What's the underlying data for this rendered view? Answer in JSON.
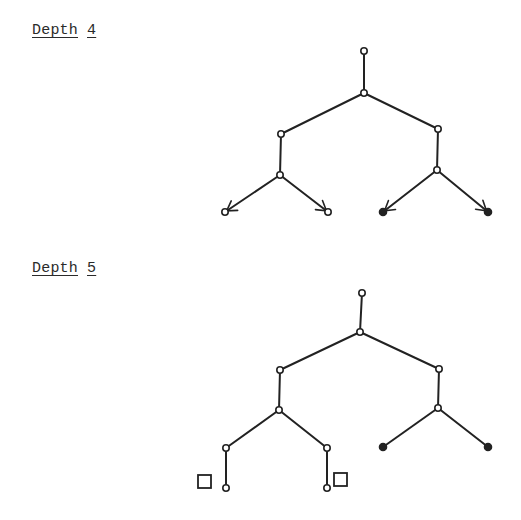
{
  "sections": [
    {
      "title_word": "Depth",
      "title_number": "4",
      "tree": {
        "nodes": [
          {
            "id": "root",
            "x": 364,
            "y": 51,
            "type": "open"
          },
          {
            "id": "n1",
            "x": 364,
            "y": 93,
            "type": "open"
          },
          {
            "id": "L",
            "x": 281,
            "y": 134,
            "type": "open"
          },
          {
            "id": "R",
            "x": 438,
            "y": 129,
            "type": "open"
          },
          {
            "id": "LL",
            "x": 280,
            "y": 175,
            "type": "open"
          },
          {
            "id": "RR",
            "x": 437,
            "y": 170,
            "type": "open"
          },
          {
            "id": "LLa",
            "x": 225,
            "y": 212,
            "type": "open",
            "arrow": true
          },
          {
            "id": "LLb",
            "x": 328,
            "y": 212,
            "type": "open",
            "arrow": true
          },
          {
            "id": "RRa",
            "x": 383,
            "y": 212,
            "type": "filled",
            "arrow": true
          },
          {
            "id": "RRb",
            "x": 488,
            "y": 212,
            "type": "filled",
            "arrow": true
          }
        ],
        "edges": [
          [
            "root",
            "n1"
          ],
          [
            "n1",
            "L"
          ],
          [
            "n1",
            "R"
          ],
          [
            "L",
            "LL"
          ],
          [
            "R",
            "RR"
          ],
          [
            "LL",
            "LLa"
          ],
          [
            "LL",
            "LLb"
          ],
          [
            "RR",
            "RRa"
          ],
          [
            "RR",
            "RRb"
          ]
        ]
      }
    },
    {
      "title_word": "Depth",
      "title_number": "5",
      "tree": {
        "nodes": [
          {
            "id": "root",
            "x": 362,
            "y": 293,
            "type": "open"
          },
          {
            "id": "n1",
            "x": 360,
            "y": 332,
            "type": "open"
          },
          {
            "id": "L",
            "x": 280,
            "y": 370,
            "type": "open"
          },
          {
            "id": "R",
            "x": 439,
            "y": 369,
            "type": "open"
          },
          {
            "id": "LL",
            "x": 279,
            "y": 410,
            "type": "open"
          },
          {
            "id": "RR",
            "x": 438,
            "y": 408,
            "type": "open"
          },
          {
            "id": "LLa",
            "x": 226,
            "y": 448,
            "type": "open"
          },
          {
            "id": "LLb",
            "x": 327,
            "y": 448,
            "type": "open"
          },
          {
            "id": "RRa",
            "x": 383,
            "y": 447,
            "type": "filled"
          },
          {
            "id": "RRb",
            "x": 488,
            "y": 447,
            "type": "filled"
          },
          {
            "id": "LLa1",
            "x": 226,
            "y": 488,
            "type": "open"
          },
          {
            "id": "LLb1",
            "x": 327,
            "y": 488,
            "type": "open"
          }
        ],
        "edges": [
          [
            "root",
            "n1"
          ],
          [
            "n1",
            "L"
          ],
          [
            "n1",
            "R"
          ],
          [
            "L",
            "LL"
          ],
          [
            "R",
            "RR"
          ],
          [
            "LL",
            "LLa"
          ],
          [
            "LL",
            "LLb"
          ],
          [
            "RR",
            "RRa"
          ],
          [
            "RR",
            "RRb"
          ],
          [
            "LLa",
            "LLa1"
          ],
          [
            "LLb",
            "LLb1"
          ]
        ],
        "boxes": [
          {
            "x": 198,
            "y": 475,
            "size": 13
          },
          {
            "x": 334,
            "y": 473,
            "size": 13
          }
        ]
      }
    }
  ]
}
